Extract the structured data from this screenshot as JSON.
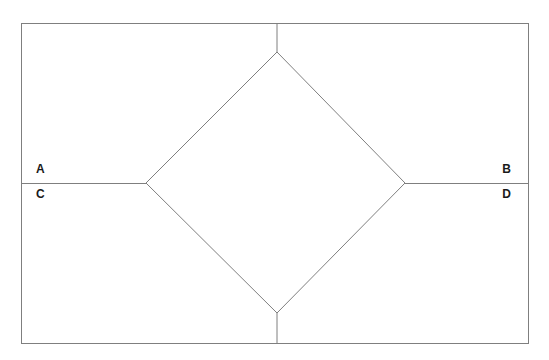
{
  "figure": {
    "background_color": "#ffffff",
    "stroke_color": "#7f7f7f",
    "label_color": "#1a1a1a",
    "stroke_width": 1,
    "canvas": {
      "width": 549,
      "height": 360
    },
    "rectangle": {
      "name": "outer-rectangle",
      "x": 21,
      "y": 23,
      "width": 508,
      "height": 321,
      "left": 21,
      "top": 23,
      "right": 529,
      "bottom": 344
    },
    "diamond": {
      "name": "inner-diamond",
      "vertices": {
        "top": {
          "x": 277,
          "y": 52
        },
        "right": {
          "x": 405,
          "y": 183
        },
        "bottom": {
          "x": 277,
          "y": 313
        },
        "left": {
          "x": 146,
          "y": 183
        }
      },
      "points": "277,52 405,183 277,313 146,183"
    },
    "connector_lines": [
      {
        "name": "line-top-stem",
        "x1": 277,
        "y1": 23,
        "x2": 277,
        "y2": 52
      },
      {
        "name": "line-bottom-stem",
        "x1": 277,
        "y1": 313,
        "x2": 277,
        "y2": 344
      },
      {
        "name": "line-left-segment",
        "x1": 21,
        "y1": 183,
        "x2": 146,
        "y2": 183
      },
      {
        "name": "line-right-segment",
        "x1": 405,
        "y1": 183,
        "x2": 529,
        "y2": 183
      }
    ],
    "labels": [
      {
        "id": "A",
        "text": "A",
        "x": 36,
        "y": 169,
        "anchor": "left",
        "position": "above-left-line"
      },
      {
        "id": "B",
        "text": "B",
        "x": 508,
        "y": 169,
        "anchor": "right",
        "position": "above-right-line"
      },
      {
        "id": "C",
        "text": "C",
        "x": 36,
        "y": 194,
        "anchor": "left",
        "position": "below-left-line"
      },
      {
        "id": "D",
        "text": "D",
        "x": 508,
        "y": 194,
        "anchor": "right",
        "position": "below-right-line"
      }
    ]
  }
}
